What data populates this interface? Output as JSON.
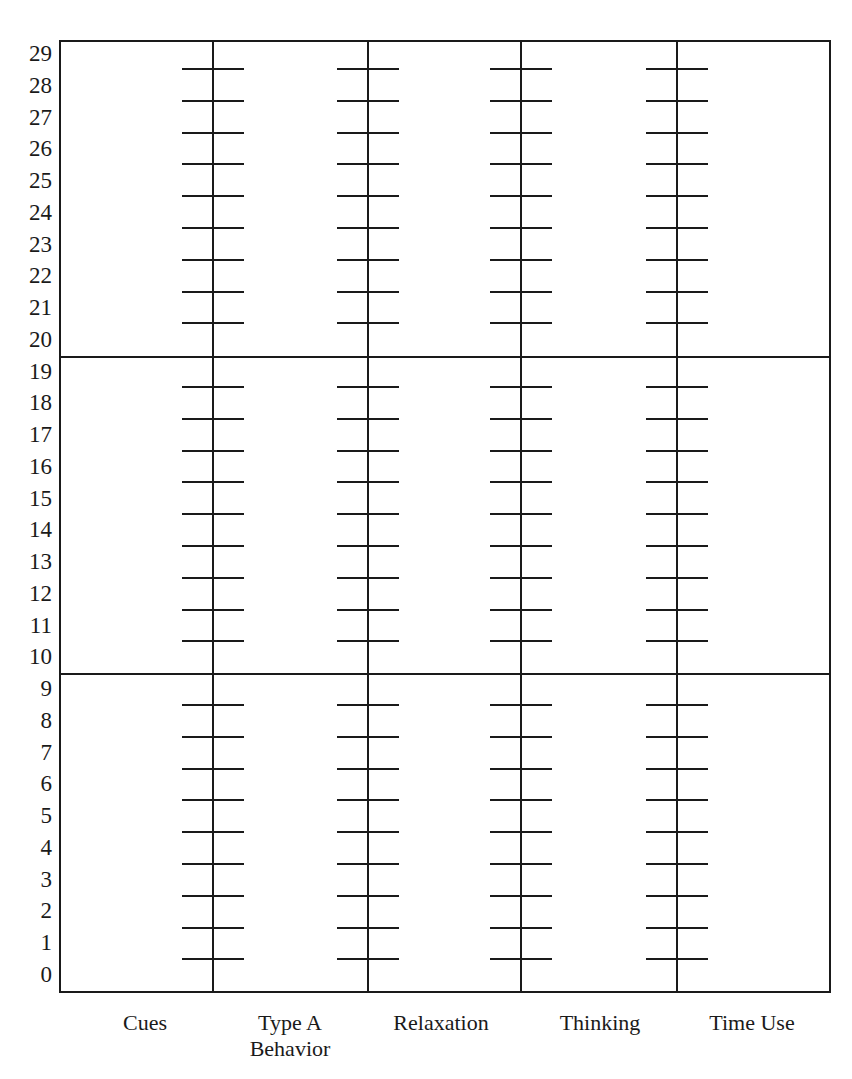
{
  "chart_data": {
    "type": "table",
    "title": "",
    "xlabel": "",
    "ylabel": "",
    "ylim": [
      0,
      29
    ],
    "y_ticks": [
      "29",
      "28",
      "27",
      "26",
      "25",
      "24",
      "23",
      "22",
      "21",
      "20",
      "19",
      "18",
      "17",
      "16",
      "15",
      "14",
      "13",
      "12",
      "11",
      "10",
      "9",
      "8",
      "7",
      "6",
      "5",
      "4",
      "3",
      "2",
      "1",
      "0"
    ],
    "categories": [
      "Cues",
      "Type A Behavior",
      "Relaxation",
      "Thinking",
      "Time Use"
    ],
    "section_dividers_between": [
      [
        20,
        19
      ],
      [
        10,
        9
      ]
    ],
    "grid": false
  },
  "y_axis": {
    "labels": [
      "29",
      "28",
      "27",
      "26",
      "25",
      "24",
      "23",
      "22",
      "21",
      "20",
      "19",
      "18",
      "17",
      "16",
      "15",
      "14",
      "13",
      "12",
      "11",
      "10",
      "9",
      "8",
      "7",
      "6",
      "5",
      "4",
      "3",
      "2",
      "1",
      "0"
    ]
  },
  "x_axis": {
    "labels": [
      {
        "line1": "Cues",
        "line2": ""
      },
      {
        "line1": "Type A",
        "line2": "Behavior"
      },
      {
        "line1": "Relaxation",
        "line2": ""
      },
      {
        "line1": "Thinking",
        "line2": ""
      },
      {
        "line1": "Time Use",
        "line2": ""
      }
    ]
  }
}
